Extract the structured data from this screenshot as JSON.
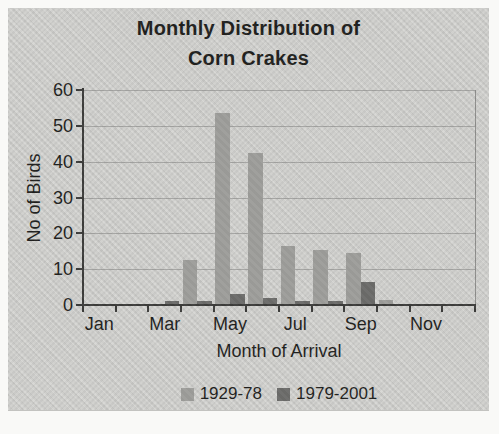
{
  "title": {
    "line1": "Monthly Distribution of",
    "line2": "Corn Crakes"
  },
  "axes": {
    "y_label": "No of Birds",
    "x_label": "Month of Arrival"
  },
  "colors": {
    "panel_bg": "#d2d2cf",
    "series_1929_78": "#9c9c99",
    "series_1979_2001": "#6a6a68",
    "gridline": "#a2a2a0",
    "axis": "#3a3a38",
    "frame": "#8b8b89",
    "text": "#1d1d1b"
  },
  "chart_data": {
    "type": "bar",
    "title": "Monthly Distribution of Corn Crakes",
    "xlabel": "Month of Arrival",
    "ylabel": "No of Birds",
    "categories": [
      "Jan",
      "Feb",
      "Mar",
      "Apr",
      "May",
      "Jun",
      "Jul",
      "Aug",
      "Sep",
      "Oct",
      "Nov",
      "Dec"
    ],
    "x_tick_labels_shown": [
      "Jan",
      "Mar",
      "May",
      "Jul",
      "Sep",
      "Nov"
    ],
    "series": [
      {
        "name": "1929-78",
        "color": "#9c9c99",
        "values": [
          0,
          0,
          0,
          12.5,
          53.5,
          42.5,
          16.5,
          15.5,
          14.5,
          1.5,
          0,
          0
        ]
      },
      {
        "name": "1979-2001",
        "color": "#6a6a68",
        "values": [
          0,
          0,
          1,
          1,
          3,
          2,
          1,
          1,
          6.5,
          0,
          0,
          0
        ]
      }
    ],
    "ylim": [
      0,
      60
    ],
    "ytick_step": 10,
    "grid": true,
    "legend_position": "bottom"
  }
}
